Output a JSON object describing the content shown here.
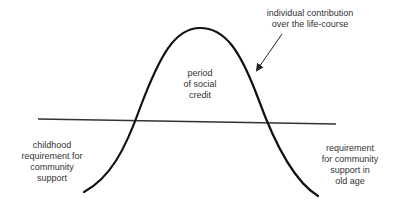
{
  "diagram": {
    "title": "",
    "labels": {
      "social_credit": "period\nof social\ncredit",
      "contribution": "individual contribution\nover the life-course",
      "childhood": "childhood\nrequirement for\ncommunity\nsupport",
      "old_age": "requirement\nfor community\nsupport in\nold age"
    },
    "colors": {
      "curve": "#111111",
      "baseline": "#333333",
      "arrow": "#222222",
      "text": "#333333"
    }
  }
}
